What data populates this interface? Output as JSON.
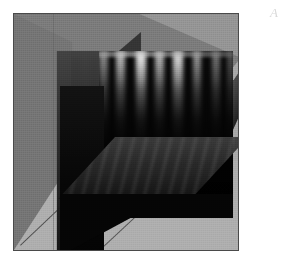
{
  "figure": {
    "label": "A",
    "caption_visible": false,
    "background_color": "#ffffff",
    "frame_color": "#4a4a4a"
  },
  "palette": {
    "box_back_wall": "#747474",
    "box_left_wall": "#6e6e6e",
    "box_floor": "#a9a9a9",
    "box_right_wedge": "#a2a2a2",
    "slice_dark": "#080808",
    "slice_mid": "#313131",
    "streak_bright": "#d2d2d2",
    "edge_line": "#3a3a3a"
  },
  "chart_data": {
    "type": "heatmap",
    "title": "",
    "subtitle": "",
    "xlabel": "",
    "ylabel": "",
    "zlabel": "",
    "rendering": "3D orthogonal slice planes through a volumetric scalar field",
    "projection": "axonometric",
    "colormap": "grayscale",
    "colormap_range": [
      0,
      1
    ],
    "grid": false,
    "legend": "none",
    "axes_visible": false,
    "tick_labels": [],
    "annotations": [
      "A"
    ],
    "planes": [
      {
        "name": "back-plane-xz",
        "orientation": "xz",
        "position_fraction": 1.0,
        "bbox_px": [
          57,
          37,
          162,
          163
        ],
        "description": "Rear vertical slice showing bright vertical streaks along the top edge decaying downward into near-black",
        "streaks": [
          {
            "x_fraction": 0.06,
            "intensity": 0.34,
            "width_fraction": 0.055
          },
          {
            "x_fraction": 0.17,
            "intensity": 0.52,
            "width_fraction": 0.06
          },
          {
            "x_fraction": 0.28,
            "intensity": 0.72,
            "width_fraction": 0.055
          },
          {
            "x_fraction": 0.4,
            "intensity": 0.95,
            "width_fraction": 0.065
          },
          {
            "x_fraction": 0.52,
            "intensity": 0.7,
            "width_fraction": 0.055
          },
          {
            "x_fraction": 0.63,
            "intensity": 0.88,
            "width_fraction": 0.06
          },
          {
            "x_fraction": 0.75,
            "intensity": 0.58,
            "width_fraction": 0.055
          },
          {
            "x_fraction": 0.87,
            "intensity": 0.44,
            "width_fraction": 0.05
          },
          {
            "x_fraction": 0.96,
            "intensity": 0.3,
            "width_fraction": 0.045
          }
        ],
        "vertical_profile": [
          {
            "depth_fraction": 0.0,
            "intensity": 1.0
          },
          {
            "depth_fraction": 0.12,
            "intensity": 0.78
          },
          {
            "depth_fraction": 0.25,
            "intensity": 0.5
          },
          {
            "depth_fraction": 0.4,
            "intensity": 0.28
          },
          {
            "depth_fraction": 0.6,
            "intensity": 0.12
          },
          {
            "depth_fraction": 0.8,
            "intensity": 0.05
          },
          {
            "depth_fraction": 1.0,
            "intensity": 0.02
          }
        ]
      },
      {
        "name": "left-plane-yz",
        "orientation": "yz",
        "position_fraction": 0.0,
        "bbox_px": [
          17,
          37,
          68,
          205
        ],
        "description": "Left vertical slice, uniformly dark with gentle top-to-bottom falloff",
        "intensity_range": [
          0.03,
          0.25
        ]
      },
      {
        "name": "mid-plane-xy",
        "orientation": "xy",
        "position_fraction": 0.5,
        "bbox_px": [
          44,
          123,
          190,
          62
        ],
        "description": "Horizontal mid-height slice drawn as a parallelogram with faint diagonal ripple texture",
        "intensity_range": [
          0.08,
          0.24
        ]
      }
    ],
    "bounding_box": {
      "visible": true,
      "faces_shaded": true,
      "edge_color": "#3a3a3a",
      "back_value": 0.455,
      "floor_value": 0.663
    }
  }
}
